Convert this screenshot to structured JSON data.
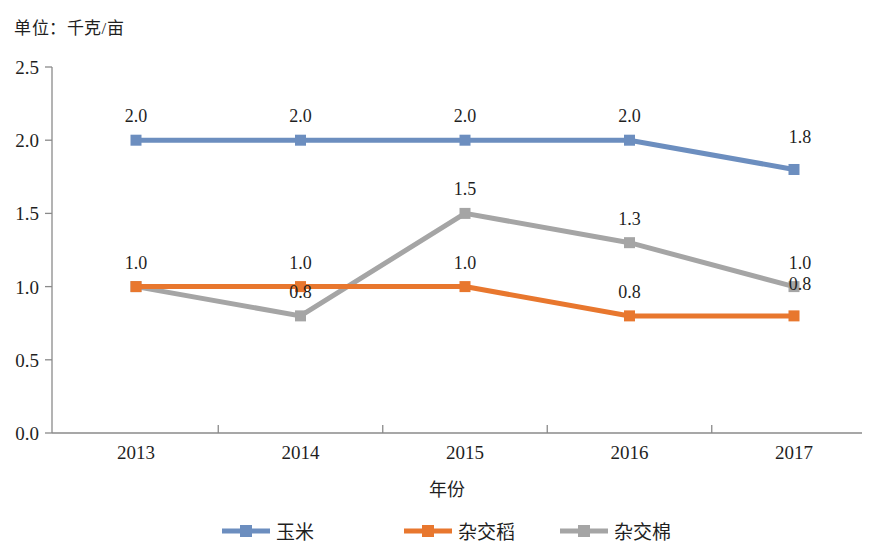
{
  "unit_note": "单位：千克/亩",
  "chart_data": {
    "type": "line",
    "title": "",
    "subtitle": "",
    "unit_note": "单位：千克/亩",
    "xlabel": "年份",
    "ylabel": "",
    "categories": [
      "2013",
      "2014",
      "2015",
      "2016",
      "2017"
    ],
    "x": [
      2013,
      2014,
      2015,
      2016,
      2017
    ],
    "ylim": [
      0.0,
      2.5
    ],
    "yticks": [
      "0.0",
      "0.5",
      "1.0",
      "1.5",
      "2.0",
      "2.5"
    ],
    "ytick_values": [
      0.0,
      0.5,
      1.0,
      1.5,
      2.0,
      2.5
    ],
    "grid": false,
    "legend_position": "bottom",
    "series": [
      {
        "name": "玉米",
        "color": "#6C8EBF",
        "values": [
          2.0,
          2.0,
          2.0,
          2.0,
          1.8
        ],
        "labels": [
          "2.0",
          "2.0",
          "2.0",
          "2.0",
          "1.8"
        ]
      },
      {
        "name": "杂交稻",
        "color": "#E8772E",
        "values": [
          1.0,
          1.0,
          1.0,
          0.8,
          0.8
        ],
        "labels": [
          "1.0",
          "1.0",
          "1.0",
          "0.8",
          "0.8"
        ]
      },
      {
        "name": "杂交棉",
        "color": "#A5A5A5",
        "values": [
          1.0,
          0.8,
          1.5,
          1.3,
          1.0
        ],
        "labels": [
          "1.0",
          "0.8",
          "1.5",
          "1.3",
          "1.0"
        ]
      }
    ]
  },
  "axis": {
    "ytick_0": "0.0",
    "ytick_1": "0.5",
    "ytick_2": "1.0",
    "ytick_3": "1.5",
    "ytick_4": "2.0",
    "ytick_5": "2.5",
    "xtick_0": "2013",
    "xtick_1": "2014",
    "xtick_2": "2015",
    "xtick_3": "2016",
    "xtick_4": "2017",
    "xlabel": "年份"
  },
  "legend": {
    "items": [
      {
        "label": "玉米",
        "color": "#6C8EBF"
      },
      {
        "label": "杂交稻",
        "color": "#E8772E"
      },
      {
        "label": "杂交棉",
        "color": "#A5A5A5"
      }
    ]
  },
  "labels": {
    "corn": [
      "2.0",
      "2.0",
      "2.0",
      "2.0",
      "1.8"
    ],
    "rice": [
      "1.0",
      "1.0",
      "1.0",
      "0.8",
      "0.8"
    ],
    "cotton": [
      "1.0",
      "0.8",
      "1.5",
      "1.3",
      "1.0"
    ]
  }
}
